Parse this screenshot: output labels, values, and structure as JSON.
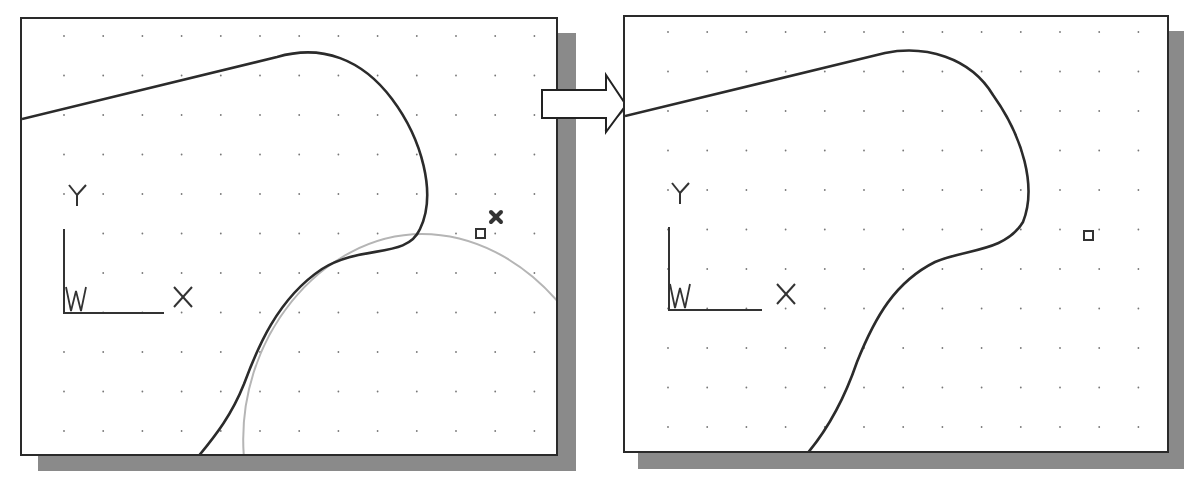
{
  "figure": {
    "transition_arrow": "right-arrow",
    "colors": {
      "frame": "#2a2a2a",
      "shadow": "#8a8a8a",
      "profile_line": "#2b2b2b",
      "construction_circle": "#b5b5b5",
      "grid_dot": "#777777"
    }
  },
  "panels": [
    {
      "name": "before",
      "ucs_icon": {
        "y_label": "Y",
        "x_label": "X",
        "w_label": "W"
      },
      "markers": [
        "selection-box",
        "x-marker"
      ],
      "shows_construction_circle": true
    },
    {
      "name": "after",
      "ucs_icon": {
        "y_label": "Y",
        "x_label": "X",
        "w_label": "W"
      },
      "markers": [
        "selection-box"
      ],
      "shows_construction_circle": false
    }
  ]
}
